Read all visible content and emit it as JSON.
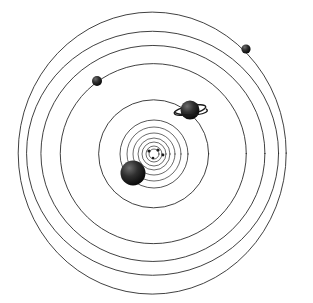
{
  "figure": {
    "background_color": "#ffffff",
    "orbit_stroke_color": "#2b2b2b",
    "body_fill_color": "#1a1a1a",
    "width": 313,
    "height": 303
  },
  "chart_data": {
    "type": "scatter",
    "subtitle": "",
    "xlabel": "",
    "ylabel": "",
    "grid": false,
    "legend_position": "none",
    "center": {
      "cx": 154,
      "cy": 154,
      "label": "sun"
    },
    "axis_note": "Coordinates are in image pixels; orbits are concentric ellipses about the sun.",
    "orbits": [
      {
        "name": "mercury-orbit",
        "index": 1,
        "rx": 5,
        "ry": 5,
        "stroke_width": 0.7
      },
      {
        "name": "venus-orbit",
        "index": 2,
        "rx": 8,
        "ry": 8,
        "stroke_width": 0.7
      },
      {
        "name": "earth-orbit",
        "index": 3,
        "rx": 12,
        "ry": 12,
        "stroke_width": 0.7
      },
      {
        "name": "mars-orbit",
        "index": 4,
        "rx": 16,
        "ry": 16,
        "stroke_width": 0.7
      },
      {
        "name": "belt-orbit-a",
        "index": 5,
        "rx": 21,
        "ry": 21,
        "stroke_width": 0.7
      },
      {
        "name": "belt-orbit-b",
        "index": 6,
        "rx": 27,
        "ry": 27,
        "stroke_width": 0.7
      },
      {
        "name": "jupiter-orbit",
        "index": 7,
        "rx": 34,
        "ry": 34,
        "stroke_width": 0.8
      },
      {
        "name": "saturn-orbit",
        "index": 8,
        "rx": 55,
        "ry": 54,
        "stroke_width": 0.9
      },
      {
        "name": "uranus-orbit",
        "index": 9,
        "rx": 93,
        "ry": 90,
        "stroke_width": 0.9
      },
      {
        "name": "neptune-orbit",
        "index": 10,
        "rx": 112,
        "ry": 108,
        "stroke_width": 0.9
      },
      {
        "name": "pluto-orbit",
        "index": 11,
        "rx": 126,
        "ry": 122,
        "stroke_width": 0.9
      },
      {
        "name": "outer-orbit",
        "index": 12,
        "rx": 134,
        "ry": 141,
        "stroke_width": 0.9
      }
    ],
    "bodies": [
      {
        "name": "inner-planet-1",
        "label": "",
        "x": 149,
        "y": 151,
        "r": 1.6,
        "kind": "planet"
      },
      {
        "name": "inner-planet-2",
        "label": "",
        "x": 158,
        "y": 150,
        "r": 1.6,
        "kind": "planet"
      },
      {
        "name": "inner-planet-3",
        "label": "",
        "x": 163,
        "y": 155,
        "r": 1.4,
        "kind": "planet"
      },
      {
        "name": "inner-planet-4",
        "label": "",
        "x": 153,
        "y": 158,
        "r": 1.3,
        "kind": "planet"
      },
      {
        "name": "jupiter",
        "label": "Jupiter",
        "x": 133,
        "y": 173,
        "r": 12.5,
        "kind": "planet"
      },
      {
        "name": "saturn",
        "label": "Saturn",
        "x": 190,
        "y": 110,
        "r": 9.5,
        "kind": "ringed-planet",
        "ring_rx": 16,
        "ring_ry": 4.2,
        "ring_tilt": -12
      },
      {
        "name": "uranus",
        "label": "Uranus",
        "x": 97,
        "y": 81,
        "r": 5.0,
        "kind": "planet"
      },
      {
        "name": "neptune",
        "label": "Neptune",
        "x": 246,
        "y": 49,
        "r": 4.6,
        "kind": "planet"
      }
    ]
  }
}
